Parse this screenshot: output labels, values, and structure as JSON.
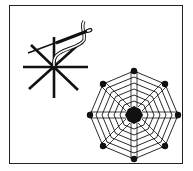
{
  "figure": {
    "kind": "embroidery-instruction-illustration",
    "steps": [
      {
        "name": "spokes-with-needle",
        "description": "eight straight-stitch spokes with a needle weaving thread around them"
      },
      {
        "name": "finished-web",
        "description": "completed woven spider web on eight spokes"
      }
    ],
    "colors": {
      "ink": "#111111",
      "paper": "#ffffff"
    }
  }
}
